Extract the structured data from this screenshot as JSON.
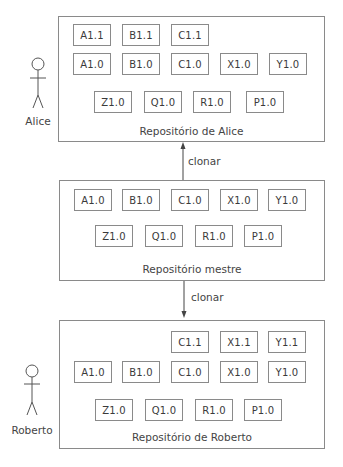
{
  "actors": {
    "alice": {
      "name": "Alice"
    },
    "roberto": {
      "name": "Roberto"
    }
  },
  "repositories": {
    "alice": {
      "label": "Repositório de Alice",
      "rows": [
        [
          "A1.1",
          "B1.1",
          "C1.1"
        ],
        [
          "A1.0",
          "B1.0",
          "C1.0",
          "X1.0",
          "Y1.0"
        ],
        [
          "Z1.0",
          "Q1.0",
          "R1.0",
          "P1.0"
        ]
      ]
    },
    "mestre": {
      "label": "Repositório mestre",
      "rows": [
        [
          "A1.0",
          "B1.0",
          "C1.0",
          "X1.0",
          "Y1.0"
        ],
        [
          "Z1.0",
          "Q1.0",
          "R1.0",
          "P1.0"
        ]
      ]
    },
    "roberto": {
      "label": "Repositório de Roberto",
      "rows": [
        [
          "C1.1",
          "X1.1",
          "Y1.1"
        ],
        [
          "A1.0",
          "B1.0",
          "C1.0",
          "X1.0",
          "Y1.0"
        ],
        [
          "Z1.0",
          "Q1.0",
          "R1.0",
          "P1.0"
        ]
      ]
    }
  },
  "arrows": {
    "mestre_to_alice": {
      "label": "clonar",
      "direction": "up"
    },
    "mestre_to_roberto": {
      "label": "clonar",
      "direction": "down"
    }
  }
}
